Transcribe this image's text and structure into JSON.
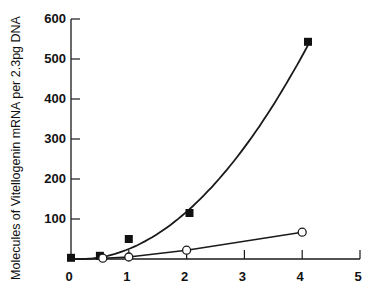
{
  "chart_data": {
    "type": "scatter",
    "title": "",
    "xlabel": "",
    "ylabel": "Molecules of Vitellogenin mRNA per 2.3pg DNA",
    "xlim": [
      0,
      5
    ],
    "ylim": [
      0,
      600
    ],
    "x_ticks": [
      "0",
      "1",
      "2",
      "3",
      "4",
      "5"
    ],
    "y_ticks": [
      "100",
      "200",
      "300",
      "400",
      "500",
      "600"
    ],
    "grid": false,
    "legend": null,
    "series": [
      {
        "name": "filled squares",
        "marker": "filled-square",
        "fit": "curve",
        "points": [
          {
            "x": 0.0,
            "y": 3
          },
          {
            "x": 0.5,
            "y": 8
          },
          {
            "x": 1.0,
            "y": 50
          },
          {
            "x": 2.05,
            "y": 115
          },
          {
            "x": 4.1,
            "y": 543
          }
        ]
      },
      {
        "name": "open circles",
        "marker": "open-circle",
        "fit": "line",
        "points": [
          {
            "x": 0.55,
            "y": 2
          },
          {
            "x": 1.0,
            "y": 5
          },
          {
            "x": 2.0,
            "y": 22
          },
          {
            "x": 4.0,
            "y": 67
          }
        ]
      }
    ]
  }
}
